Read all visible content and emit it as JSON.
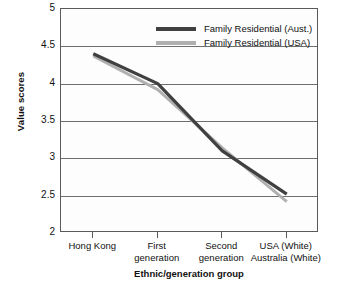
{
  "chart_data": {
    "type": "line",
    "title": "",
    "xlabel": "Ethnic/generation group",
    "ylabel": "Value scores",
    "categories": [
      "Hong Kong",
      "First generation",
      "Second generation",
      "USA (White) Australia (White)"
    ],
    "category_lines": [
      [
        "Hong Kong"
      ],
      [
        "First",
        "generation"
      ],
      [
        "Second",
        "generation"
      ],
      [
        "USA (White)",
        "Australia (White)"
      ]
    ],
    "ylim": [
      2,
      5
    ],
    "yticks": [
      5,
      4.5,
      4,
      3.5,
      3,
      2.5,
      2
    ],
    "ytick_labels": [
      "5",
      "4.5",
      "4",
      "3.5",
      "3",
      "2.5",
      "2"
    ],
    "grid": true,
    "legend_position": "top-right-inside",
    "series": [
      {
        "name": "Family Residential (Aust.)",
        "color": "#404040",
        "values": [
          4.4,
          4.0,
          3.1,
          2.52
        ]
      },
      {
        "name": "Family Residential (USA)",
        "color": "#b0b0b0",
        "values": [
          4.37,
          3.92,
          3.14,
          2.42
        ]
      }
    ]
  },
  "axes": {
    "y_title": "Value scores",
    "x_title": "Ethnic/generation group",
    "y_tick_labels": [
      "5",
      "4.5",
      "4",
      "3.5",
      "3",
      "2.5",
      "2"
    ]
  },
  "legend": {
    "items": [
      {
        "label": "Family Residential (Aust.)",
        "color": "#404040"
      },
      {
        "label": "Family Residential (USA)",
        "color": "#b0b0b0"
      }
    ]
  },
  "colors": {
    "aust": "#404040",
    "usa": "#b0b0b0",
    "grid": "#6e6e6e",
    "frame": "#5a5a5a",
    "text": "#111111",
    "background": "#ffffff"
  }
}
